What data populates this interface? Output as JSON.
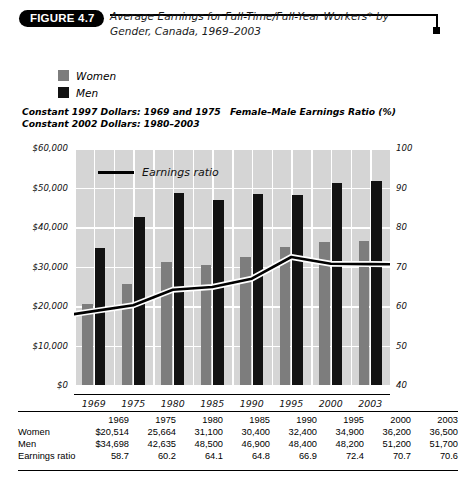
{
  "header": {
    "badge": "FIGURE 4.7",
    "title": "Average Earnings for Full-Time/Full-Year  Workers* by Gender, Canada, 1969–2003"
  },
  "legend": {
    "items": [
      {
        "label": "Women",
        "color": "#7d7d7d"
      },
      {
        "label": "Men",
        "color": "#121212"
      }
    ]
  },
  "notes": {
    "dollars_line1": "Constant 1997 Dollars: 1969 and 1975",
    "dollars_line2": "Constant 2002 Dollars: 1980–2003",
    "ratio_axis": "Female–Male Earnings Ratio (%)"
  },
  "chart_data": {
    "type": "bar",
    "title": "Average Earnings for Full-Time/Full-Year  Workers* by Gender, Canada, 1969–2003",
    "subtitle": "Constant 1997 Dollars: 1969 and 1975; Constant 2002 Dollars: 1980–2003",
    "xlabel": "",
    "ylabel": "",
    "y2label": "Female–Male Earnings Ratio (%)",
    "categories": [
      "1969",
      "1975",
      "1980",
      "1985",
      "1990",
      "1995",
      "2000",
      "2003"
    ],
    "series": [
      {
        "name": "Women",
        "type": "bar",
        "axis": "left",
        "color": "#7d7d7d",
        "values": [
          20514,
          25664,
          31100,
          30400,
          32400,
          34900,
          36200,
          36500
        ]
      },
      {
        "name": "Men",
        "type": "bar",
        "axis": "left",
        "color": "#121212",
        "values": [
          34698,
          42635,
          48500,
          46900,
          48400,
          48200,
          51200,
          51700
        ]
      },
      {
        "name": "Earnings ratio",
        "type": "line",
        "axis": "right",
        "color": "#000000",
        "values": [
          58.7,
          60.2,
          64.1,
          64.8,
          66.9,
          72.4,
          70.7,
          70.6
        ]
      }
    ],
    "ylim": [
      0,
      60000
    ],
    "yticks": [
      0,
      10000,
      20000,
      30000,
      40000,
      50000,
      60000
    ],
    "ytick_labels": [
      "$0",
      "$10,000",
      "$20,000",
      "$30,000",
      "$40,000",
      "$50,000",
      "$60,000"
    ],
    "y2lim": [
      40,
      100
    ],
    "y2ticks": [
      40,
      50,
      60,
      70,
      80,
      90,
      100
    ],
    "y2tick_labels": [
      "40",
      "50",
      "60",
      "70",
      "80",
      "90",
      "100"
    ],
    "grid": true,
    "legend_position": "top-left",
    "inline_legend_label": "Earnings ratio"
  },
  "table": {
    "corner": "",
    "headers": [
      "1969",
      "1975",
      "1980",
      "1985",
      "1990",
      "1995",
      "2000",
      "2003"
    ],
    "rows": [
      {
        "label": "Women",
        "values": [
          "$20,514",
          "25,664",
          "31,100",
          "30,400",
          "32,400",
          "34,900",
          "36,200",
          "36,500"
        ]
      },
      {
        "label": "Men",
        "values": [
          "$34,698",
          "42,635",
          "48,500",
          "46,900",
          "48,400",
          "48,200",
          "51,200",
          "51,700"
        ]
      },
      {
        "label": "Earnings ratio",
        "values": [
          "58.7",
          "60.2",
          "64.1",
          "64.8",
          "66.9",
          "72.4",
          "70.7",
          "70.6"
        ]
      }
    ]
  }
}
